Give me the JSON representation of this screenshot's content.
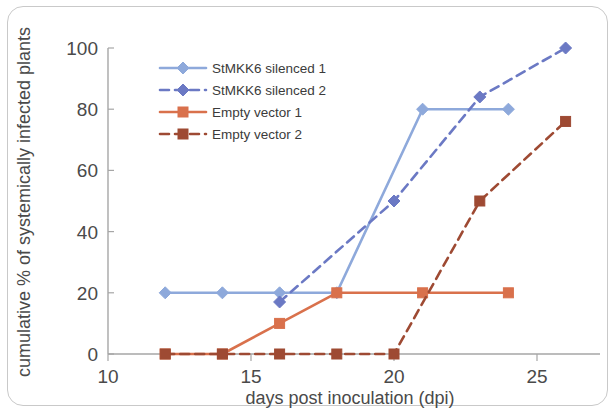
{
  "chart_data": {
    "type": "line",
    "title": "",
    "xlabel": "days post inoculation (dpi)",
    "ylabel": "cumulative % of systemically infected plants",
    "xlim": [
      10,
      27
    ],
    "ylim": [
      0,
      100
    ],
    "xticks": [
      10,
      15,
      20,
      25
    ],
    "yticks": [
      0,
      20,
      40,
      60,
      80,
      100
    ],
    "xtick_labels": [
      "10",
      "15",
      "20",
      "25"
    ],
    "ytick_labels": [
      "0",
      "20",
      "40",
      "60",
      "80",
      "100"
    ],
    "grid": false,
    "legend_position": "upper-left-inside",
    "series": [
      {
        "name": "StMKK6 silenced 1",
        "color": "#8EA9DB",
        "style": "solid",
        "marker": "diamond",
        "x": [
          12,
          14,
          16,
          18,
          21,
          24
        ],
        "y": [
          20,
          20,
          20,
          20,
          80,
          80
        ]
      },
      {
        "name": "StMKK6 silenced 2",
        "color": "#6B79C4",
        "style": "dashed",
        "marker": "diamond",
        "x": [
          16,
          20,
          23,
          26
        ],
        "y": [
          17,
          50,
          84,
          100
        ]
      },
      {
        "name": "Empty vector 1",
        "color": "#D9714C",
        "style": "solid",
        "marker": "square",
        "x": [
          12,
          14,
          16,
          18,
          21,
          24
        ],
        "y": [
          0,
          0,
          10,
          20,
          20,
          20
        ]
      },
      {
        "name": "Empty vector 2",
        "color": "#9E4A33",
        "style": "dashed",
        "marker": "square",
        "x": [
          12,
          14,
          16,
          18,
          20,
          23,
          26
        ],
        "y": [
          0,
          0,
          0,
          0,
          0,
          50,
          76
        ]
      }
    ]
  },
  "legend": {
    "items": [
      {
        "label": "StMKK6 silenced 1",
        "color": "#8EA9DB",
        "style": "solid",
        "marker": "diamond"
      },
      {
        "label": "StMKK6 silenced 2",
        "color": "#6B79C4",
        "style": "dashed",
        "marker": "diamond"
      },
      {
        "label": "Empty vector 1",
        "color": "#D9714C",
        "style": "solid",
        "marker": "square"
      },
      {
        "label": "Empty vector 2",
        "color": "#9E4A33",
        "style": "dashed",
        "marker": "square"
      }
    ]
  },
  "axes": {
    "x_title": "days post inoculation (dpi)",
    "y_title": "cumulative % of systemically infected plants",
    "axis_color": "#a6a6a6"
  }
}
